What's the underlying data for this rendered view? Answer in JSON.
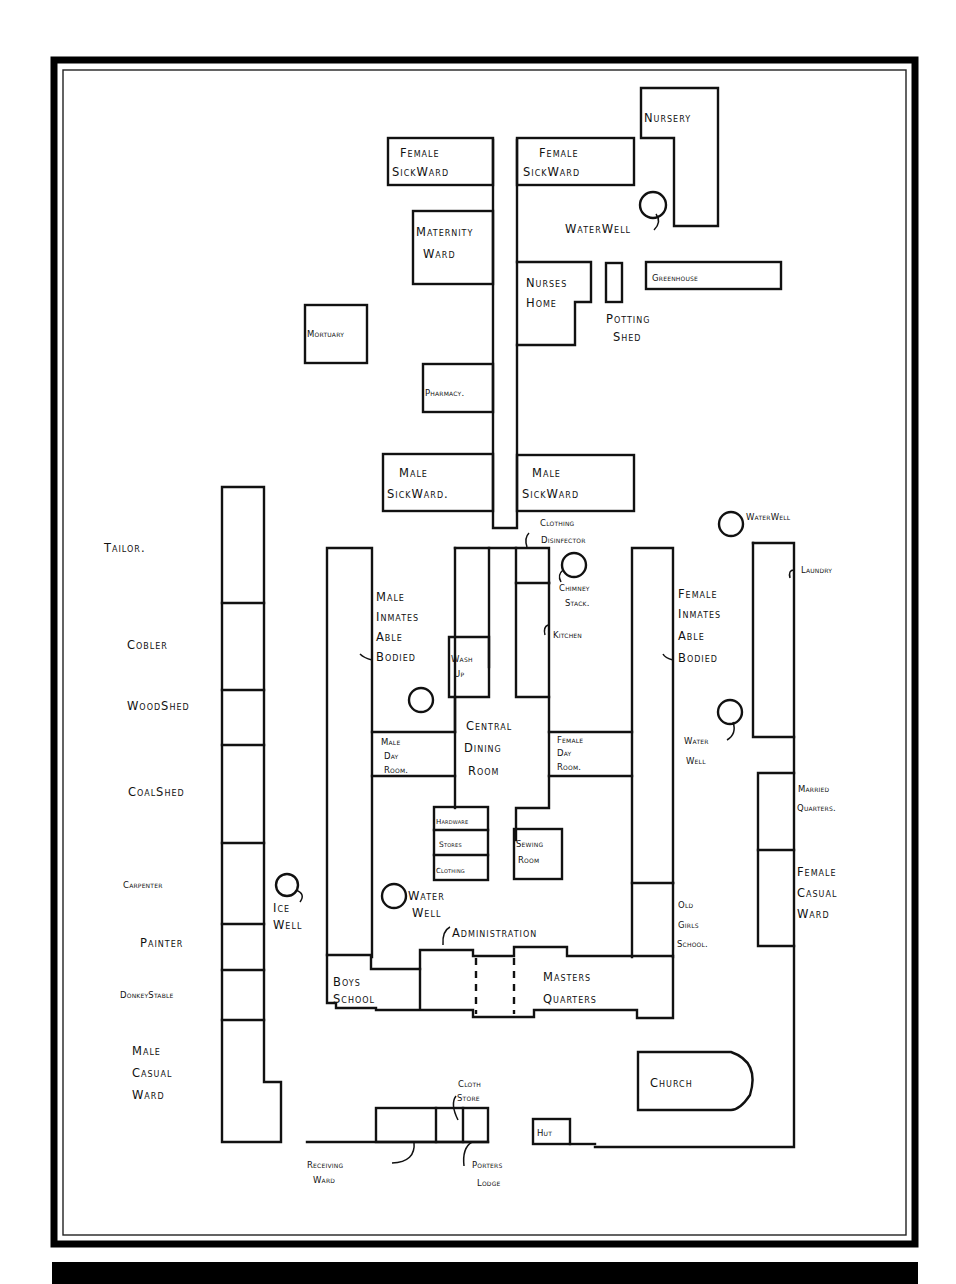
{
  "plan": {
    "type": "workhouse site plan",
    "north_wing": {
      "female_sick_ward_left": [
        "Female",
        "SickWard"
      ],
      "female_sick_ward_right": [
        "Female",
        "SickWard"
      ],
      "nursery": "Nursery",
      "water_well_north": "WaterWell",
      "maternity_ward": [
        "Maternity",
        "Ward"
      ],
      "nurses_home": [
        "Nurses",
        "Home"
      ],
      "potting_shed": [
        "Potting",
        "Shed"
      ],
      "greenhouse": "Greenhouse",
      "mortuary": "Mortuary",
      "pharmacy": "Pharmacy.",
      "male_sick_ward_left": [
        "Male",
        "SickWard."
      ],
      "male_sick_ward_right": [
        "Male",
        "SickWard"
      ]
    },
    "west_range": {
      "tailor": "Tailor.",
      "cobler": "Cobler",
      "wood_shed": "WoodShed",
      "coal_shed": "CoalShed",
      "carpenter": "Carpenter",
      "painter": "Painter",
      "donkey_stable": "DonkeyStable",
      "male_casual_ward": [
        "Male",
        "Casual",
        "Ward"
      ],
      "ice_well": [
        "Ice",
        "Well"
      ]
    },
    "main_block": {
      "clothing_disinfector": [
        "Clothing",
        "Disinfector"
      ],
      "chimney_stack": [
        "Chimney",
        "Stack."
      ],
      "male_inmates": [
        "Male",
        "Inmates",
        "Able",
        "Bodied"
      ],
      "wash_up": [
        "Wash",
        "Up"
      ],
      "kitchen": "Kitchen",
      "female_inmates": [
        "Female",
        "Inmates",
        "Able",
        "Bodied"
      ],
      "male_day_room": [
        "Male",
        "Day",
        "Room."
      ],
      "central_dining_room": [
        "Central",
        "Dining",
        "Room"
      ],
      "female_day_room": [
        "Female",
        "Day",
        "Room."
      ],
      "hardware": "Hardware",
      "stores": "Stores",
      "clothing": "Clothing",
      "sewing_room": [
        "Sewing",
        "Room"
      ],
      "water_well_court": [
        "Water",
        "Well"
      ],
      "administration": "Administration",
      "boys_school": [
        "Boys",
        "School"
      ],
      "masters_quarters": [
        "Masters",
        "Quarters"
      ],
      "old_girls_school": [
        "Old",
        "Girls",
        "School."
      ]
    },
    "east_range": {
      "water_well_east": "WaterWell",
      "laundry": "Laundry",
      "water_well_east2": [
        "Water",
        "Well"
      ],
      "married_quarters": [
        "Married",
        "Quarters."
      ],
      "female_casual_ward": [
        "Female",
        "Casual",
        "Ward"
      ]
    },
    "south": {
      "church": "Church",
      "hut": "Hut",
      "cloth_store": [
        "Cloth",
        "Store"
      ],
      "receiving_ward": [
        "Receiving",
        "Ward"
      ],
      "porters_lodge": [
        "Porters",
        "Lodge"
      ]
    }
  }
}
